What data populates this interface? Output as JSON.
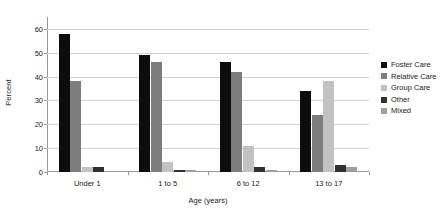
{
  "chart_data": {
    "type": "bar",
    "title": "",
    "subtitle": "",
    "xlabel": "Age (years)",
    "ylabel": "Percent",
    "categories": [
      "Under 1",
      "1 to 5",
      "6 to 12",
      "13 to 17"
    ],
    "series": [
      {
        "name": "Foster Care",
        "color": "#0d0d0d",
        "values": [
          58,
          49,
          46,
          34
        ]
      },
      {
        "name": "Relative Care",
        "color": "#7d7d7d",
        "values": [
          38,
          46,
          42,
          24
        ]
      },
      {
        "name": "Group Care",
        "color": "#c2c2c2",
        "values": [
          2,
          4,
          11,
          38
        ]
      },
      {
        "name": "Other",
        "color": "#303030",
        "values": [
          2,
          1,
          2,
          3
        ]
      },
      {
        "name": "Mixed",
        "color": "#9e9e9e",
        "values": [
          0,
          1,
          1,
          2
        ]
      }
    ],
    "ylim": [
      0,
      65
    ],
    "yticks": [
      0,
      10,
      20,
      30,
      40,
      50,
      60
    ],
    "ytick_labels": [
      "0",
      "10",
      "20",
      "30",
      "40",
      "50",
      "60"
    ],
    "grid": true,
    "grid_axis": "y",
    "legend_position": "right",
    "background_color": "#ffffff",
    "axis_color": "#9a9a9a",
    "gridline_color": "#d2d2d2"
  }
}
